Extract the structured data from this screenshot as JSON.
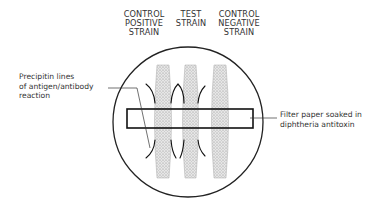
{
  "diagram": {
    "title_hint": "Elek plate gel precipitation test",
    "column_headers": [
      {
        "lines": [
          "CONTROL",
          "POSITIVE",
          "STRAIN"
        ]
      },
      {
        "lines": [
          "TEST",
          "STRAIN"
        ]
      },
      {
        "lines": [
          "CONTROL",
          "NEGATIVE",
          "STRAIN"
        ]
      }
    ],
    "left_label": {
      "lines": [
        "Precipitin lines",
        "of antigen/antibody",
        "reaction"
      ]
    },
    "right_label": {
      "lines": [
        "Filter paper soaked in",
        "diphtheria antitoxin"
      ]
    },
    "colors": {
      "line": "#222222",
      "strip_fill": "#d9d9d9",
      "background": "#ffffff"
    }
  }
}
